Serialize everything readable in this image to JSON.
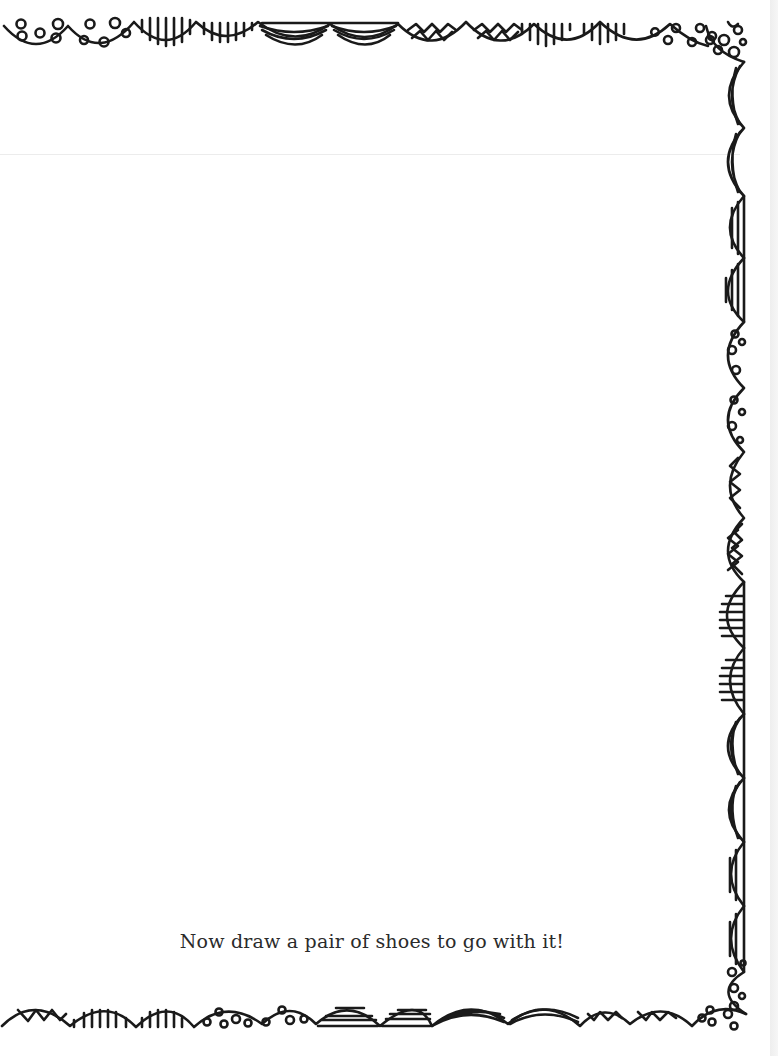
{
  "page": {
    "instruction": "Now draw a pair of shoes to go with it!",
    "ink_color": "#1a1a1a",
    "paper_color": "#ffffff"
  },
  "border": {
    "style": "hand-drawn scalloped doodle border",
    "top_patterns": [
      "dots",
      "dots",
      "vertical-lines",
      "vertical-lines",
      "arcs",
      "arcs",
      "zigzag",
      "zigzag",
      "vertical-lines",
      "vertical-lines",
      "dots",
      "dots-corner"
    ],
    "right_patterns": [
      "arcs",
      "arcs",
      "stripes",
      "stripes",
      "dots",
      "dots",
      "zigzag",
      "zigzag",
      "lines",
      "lines",
      "arcs",
      "arcs",
      "stripes",
      "stripes",
      "dots-corner"
    ],
    "bottom_patterns": [
      "zigzag",
      "vertical-lines",
      "vertical-lines",
      "dots",
      "dots",
      "stripes",
      "stripes",
      "arcs",
      "arcs",
      "zigzag",
      "zigzag",
      "dots"
    ]
  }
}
